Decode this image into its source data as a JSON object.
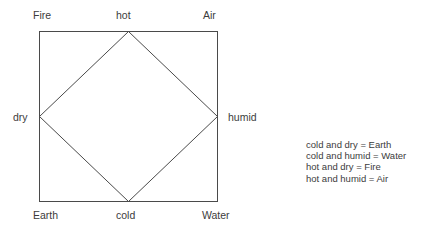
{
  "diagram": {
    "line_color": "#4a4a4a",
    "background": "#ffffff",
    "square": {
      "corners": [
        {
          "id": "fire",
          "label": "Fire",
          "position": "top-left"
        },
        {
          "id": "air",
          "label": "Air",
          "position": "top-right"
        },
        {
          "id": "earth",
          "label": "Earth",
          "position": "bottom-left"
        },
        {
          "id": "water",
          "label": "Water",
          "position": "bottom-right"
        }
      ]
    },
    "diamond": {
      "vertices": [
        {
          "id": "hot",
          "label": "hot",
          "position": "top"
        },
        {
          "id": "humid",
          "label": "humid",
          "position": "right"
        },
        {
          "id": "cold",
          "label": "cold",
          "position": "bottom"
        },
        {
          "id": "dry",
          "label": "dry",
          "position": "left"
        }
      ]
    }
  },
  "legend": {
    "lines": [
      "cold and dry = Earth",
      "cold and humid = Water",
      "hot and dry = Fire",
      "hot and humid = Air"
    ]
  }
}
